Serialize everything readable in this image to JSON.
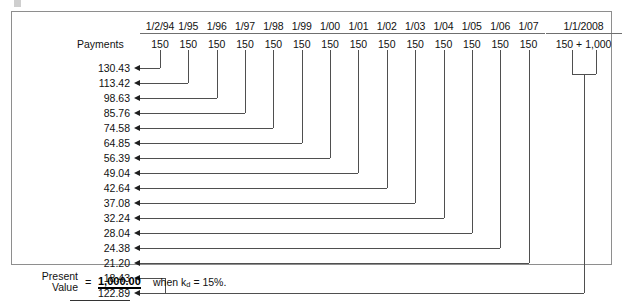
{
  "figure": {
    "type": "bond-valuation-timeline",
    "row_label": "Payments",
    "dates": [
      "1/2/94",
      "1/95",
      "1/96",
      "1/97",
      "1/98",
      "1/99",
      "1/00",
      "1/01",
      "1/02",
      "1/03",
      "1/04",
      "1/05",
      "1/06",
      "1/07",
      "1/1/2008"
    ],
    "payments": [
      "150",
      "150",
      "150",
      "150",
      "150",
      "150",
      "150",
      "150",
      "150",
      "150",
      "150",
      "150",
      "150",
      "150",
      "150 + 1,000"
    ],
    "present_values": [
      "130.43",
      "113.42",
      "98.63",
      "85.76",
      "74.58",
      "64.85",
      "56.39",
      "49.04",
      "42.64",
      "37.08",
      "32.24",
      "28.04",
      "24.38",
      "21.20",
      "18.43",
      "122.89"
    ],
    "total_label_line1": "Present",
    "total_label_line2": "Value",
    "equals_sign": "=",
    "total_value": "1,000.00",
    "rate_text": "when k",
    "rate_subscript": "d",
    "rate_value": "= 15%."
  },
  "chart_data": {
    "type": "table",
    "xlabel": "Payment date",
    "ylabel": "Present value",
    "categories": [
      "1/2/94",
      "1/95",
      "1/96",
      "1/97",
      "1/98",
      "1/99",
      "1/00",
      "1/01",
      "1/02",
      "1/03",
      "1/04",
      "1/05",
      "1/06",
      "1/07",
      "1/1/2008 coupon",
      "1/1/2008 principal"
    ],
    "series": [
      {
        "name": "Payment",
        "values": [
          150,
          150,
          150,
          150,
          150,
          150,
          150,
          150,
          150,
          150,
          150,
          150,
          150,
          150,
          150,
          1000
        ]
      },
      {
        "name": "Present value",
        "values": [
          130.43,
          113.42,
          98.63,
          85.76,
          74.58,
          64.85,
          56.39,
          49.04,
          42.64,
          37.08,
          32.24,
          28.04,
          24.38,
          21.2,
          18.43,
          122.89
        ]
      }
    ],
    "total": 1000.0,
    "discount_rate": 0.15,
    "legend": [
      "Payments",
      "Present Value"
    ],
    "grid": false
  }
}
